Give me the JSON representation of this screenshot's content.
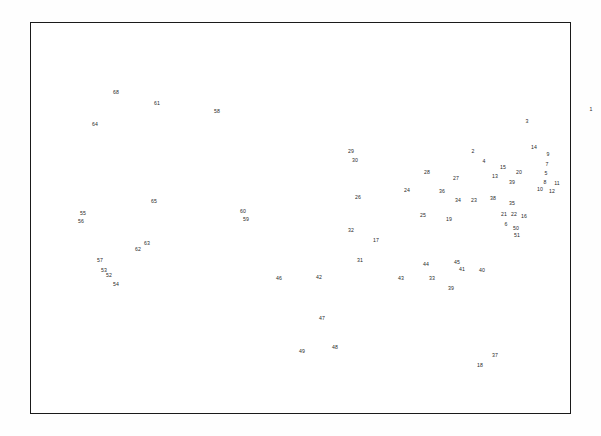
{
  "page": {
    "background_color": "#ffffff",
    "frame": {
      "border_color": "#1a1a1a",
      "x": 30,
      "y": 22,
      "width": 541,
      "height": 392
    },
    "map": {
      "outline_color": "#2b2b2b",
      "fill_color": "#ffffff",
      "label_color": "#2a2a2a",
      "label_font_size": "5.2px"
    }
  },
  "chart_data": {
    "type": "map",
    "xlabel": "",
    "ylabel": "",
    "legend": "none",
    "grid": false,
    "label_count": 66,
    "labels": [
      {
        "id": 1,
        "text": "1",
        "x": 561,
        "y": 88
      },
      {
        "id": 3,
        "text": "3",
        "x": 497,
        "y": 100
      },
      {
        "id": 2,
        "text": "2",
        "x": 443,
        "y": 130
      },
      {
        "id": 4,
        "text": "4",
        "x": 454,
        "y": 140
      },
      {
        "id": 14,
        "text": "14",
        "x": 504,
        "y": 126
      },
      {
        "id": 9,
        "text": "9",
        "x": 518,
        "y": 133
      },
      {
        "id": 7,
        "text": "7",
        "x": 517,
        "y": 143
      },
      {
        "id": 15,
        "text": "15",
        "x": 473,
        "y": 146
      },
      {
        "id": 5,
        "text": "5",
        "x": 516,
        "y": 152
      },
      {
        "id": 20,
        "text": "20",
        "x": 489,
        "y": 151
      },
      {
        "id": 13,
        "text": "13",
        "x": 465,
        "y": 155
      },
      {
        "id": 8,
        "text": "8",
        "x": 515,
        "y": 161
      },
      {
        "id": 11,
        "text": "11",
        "x": 527,
        "y": 162
      },
      {
        "id": 10,
        "text": "10",
        "x": 510,
        "y": 168
      },
      {
        "id": 12,
        "text": "12",
        "x": 522,
        "y": 170
      },
      {
        "id": 29,
        "text": "29",
        "x": 321,
        "y": 130
      },
      {
        "id": 30,
        "text": "30",
        "x": 325,
        "y": 139
      },
      {
        "id": 28,
        "text": "28",
        "x": 397,
        "y": 151
      },
      {
        "id": 27,
        "text": "27",
        "x": 426,
        "y": 157
      },
      {
        "id": 39,
        "text": "39",
        "x": 482,
        "y": 161
      },
      {
        "id": 24,
        "text": "24",
        "x": 377,
        "y": 169
      },
      {
        "id": 36,
        "text": "36",
        "x": 412,
        "y": 170
      },
      {
        "id": 34,
        "text": "34",
        "x": 428,
        "y": 179
      },
      {
        "id": 23,
        "text": "23",
        "x": 444,
        "y": 179
      },
      {
        "id": 38,
        "text": "38",
        "x": 463,
        "y": 177
      },
      {
        "id": 35,
        "text": "35",
        "x": 482,
        "y": 182
      },
      {
        "id": 26,
        "text": "26",
        "x": 328,
        "y": 176
      },
      {
        "id": 25,
        "text": "25",
        "x": 393,
        "y": 194
      },
      {
        "id": 21,
        "text": "21",
        "x": 474,
        "y": 193
      },
      {
        "id": 22,
        "text": "22",
        "x": 484,
        "y": 193
      },
      {
        "id": 16,
        "text": "16",
        "x": 494,
        "y": 195
      },
      {
        "id": 19,
        "text": "19",
        "x": 419,
        "y": 198
      },
      {
        "id": 6,
        "text": "6",
        "x": 476,
        "y": 203
      },
      {
        "id": 50,
        "text": "50",
        "x": 486,
        "y": 207
      },
      {
        "id": 51,
        "text": "51",
        "x": 487,
        "y": 214
      },
      {
        "id": 32,
        "text": "32",
        "x": 321,
        "y": 209
      },
      {
        "id": 17,
        "text": "17",
        "x": 346,
        "y": 219
      },
      {
        "id": 31,
        "text": "31",
        "x": 330,
        "y": 239
      },
      {
        "id": 44,
        "text": "44",
        "x": 396,
        "y": 243
      },
      {
        "id": 45,
        "text": "45",
        "x": 427,
        "y": 241
      },
      {
        "id": 40,
        "text": "40",
        "x": 452,
        "y": 249
      },
      {
        "id": 41,
        "text": "41",
        "x": 432,
        "y": 248
      },
      {
        "id": 43,
        "text": "43",
        "x": 371,
        "y": 257
      },
      {
        "id": 33,
        "text": "33",
        "x": 402,
        "y": 257
      },
      {
        "id": 39,
        "text": "39",
        "x": 421,
        "y": 267
      },
      {
        "id": 46,
        "text": "46",
        "x": 249,
        "y": 257
      },
      {
        "id": 42,
        "text": "42",
        "x": 289,
        "y": 256
      },
      {
        "id": 47,
        "text": "47",
        "x": 292,
        "y": 297
      },
      {
        "id": 49,
        "text": "49",
        "x": 272,
        "y": 330
      },
      {
        "id": 48,
        "text": "48",
        "x": 305,
        "y": 326
      },
      {
        "id": 37,
        "text": "37",
        "x": 465,
        "y": 334
      },
      {
        "id": 18,
        "text": "18",
        "x": 450,
        "y": 344
      },
      {
        "id": 68,
        "text": "68",
        "x": 86,
        "y": 71
      },
      {
        "id": 64,
        "text": "64",
        "x": 65,
        "y": 103
      },
      {
        "id": 61,
        "text": "61",
        "x": 127,
        "y": 82
      },
      {
        "id": 58,
        "text": "58",
        "x": 187,
        "y": 90
      },
      {
        "id": 55,
        "text": "55",
        "x": 53,
        "y": 192
      },
      {
        "id": 56,
        "text": "56",
        "x": 51,
        "y": 200
      },
      {
        "id": 65,
        "text": "65",
        "x": 124,
        "y": 180
      },
      {
        "id": 60,
        "text": "60",
        "x": 213,
        "y": 190
      },
      {
        "id": 59,
        "text": "59",
        "x": 216,
        "y": 198
      },
      {
        "id": 62,
        "text": "62",
        "x": 108,
        "y": 228
      },
      {
        "id": 63,
        "text": "63",
        "x": 117,
        "y": 222
      },
      {
        "id": 57,
        "text": "57",
        "x": 70,
        "y": 239
      },
      {
        "id": 53,
        "text": "53",
        "x": 74,
        "y": 249
      },
      {
        "id": 52,
        "text": "52",
        "x": 79,
        "y": 254
      },
      {
        "id": 54,
        "text": "54",
        "x": 86,
        "y": 263
      }
    ]
  }
}
